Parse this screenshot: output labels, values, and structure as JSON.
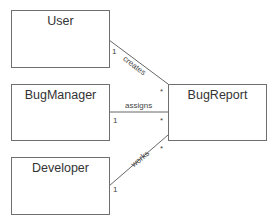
{
  "diagram": {
    "type": "uml-class-diagram",
    "classes": [
      {
        "id": "user",
        "name": "User"
      },
      {
        "id": "bugmanager",
        "name": "BugManager"
      },
      {
        "id": "developer",
        "name": "Developer"
      },
      {
        "id": "bugreport",
        "name": "BugReport"
      }
    ],
    "associations": [
      {
        "from": "User",
        "to": "BugReport",
        "label": "creates",
        "from_mult": "1",
        "to_mult": "*"
      },
      {
        "from": "BugManager",
        "to": "BugReport",
        "label": "assigns",
        "from_mult": "1",
        "to_mult": "*"
      },
      {
        "from": "Developer",
        "to": "BugReport",
        "label": "works",
        "from_mult": "1",
        "to_mult": "*"
      }
    ],
    "colors": {
      "line": "#555555",
      "border": "#6f6f6f",
      "text": "#333333"
    }
  }
}
